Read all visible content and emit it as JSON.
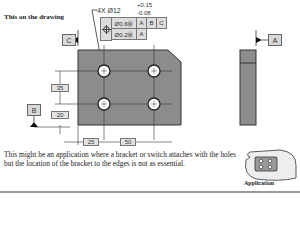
{
  "header": {
    "title": "This on the drawing"
  },
  "callout": {
    "quantity_diameter": "4X Ø12",
    "tol_upper": "+0.15",
    "tol_lower": "-0.08"
  },
  "feature_control_frame": {
    "symbol": "position-icon",
    "rows": [
      {
        "tolerance": "Ø0.6Ⓜ",
        "datums": [
          "A",
          "B",
          "C"
        ]
      },
      {
        "tolerance": "Ø0.2Ⓜ",
        "datums": [
          "A"
        ]
      }
    ]
  },
  "datums": {
    "a": "A",
    "b": "B",
    "c": "C"
  },
  "dimensions": {
    "vertical_spacing": "35",
    "vertical_offset": "20",
    "horizontal_offset": "25",
    "horizontal_spacing": "50"
  },
  "paragraph": "This might be an application where a bracket or switch attaches with the holes but the location of the bracket to the edges is not as essential.",
  "application": {
    "label": "Application"
  },
  "colors": {
    "plate": "#8c8c8c",
    "frame_bg": "#dddddd",
    "text": "#222222"
  }
}
